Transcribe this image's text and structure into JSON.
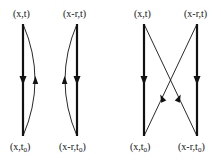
{
  "diagram": {
    "left_panel": {
      "top_labels": [
        "(x,t)",
        "(x-r,t)"
      ],
      "bottom_labels": [
        {
          "base": "(x,t",
          "sub": "0",
          "close": ")"
        },
        {
          "base": "(x-r,t",
          "sub": "0",
          "close": ")"
        }
      ],
      "description": "Two vertical thick downward arrows, each with a curved thin upward return arrow"
    },
    "right_panel": {
      "top_labels": [
        "(x,t)",
        "(x-r,t)"
      ],
      "bottom_labels": [
        {
          "base": "(x,t",
          "sub": "0",
          "close": ")"
        },
        {
          "base": "(x-r,t",
          "sub": "0",
          "close": ")"
        }
      ],
      "description": "Two vertical thick downward arrows with crossing thin diagonal upward arrows"
    },
    "colors": {
      "stroke": "#111111",
      "background": "#ffffff"
    }
  }
}
